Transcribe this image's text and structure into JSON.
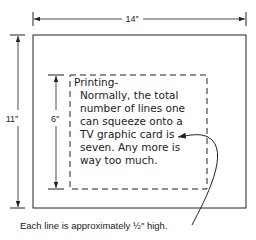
{
  "diagram": {
    "width_dimension": {
      "label": "14″"
    },
    "height_dimension": {
      "label": "11″"
    },
    "safe_area_dimension": {
      "label": "6″"
    },
    "safe_area_text": {
      "lines": [
        "Printing-",
        "Normally, the total",
        "number of lines one",
        "can squeeze onto a",
        "TV graphic card is",
        "seven. Any more is",
        "way too much."
      ]
    },
    "caption": "Each line is approximately ½″ high.",
    "colors": {
      "ink": "#222222",
      "background": "#ffffff"
    }
  }
}
